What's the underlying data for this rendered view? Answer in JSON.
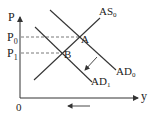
{
  "diagram": {
    "type": "AS-AD economics diagram",
    "axes": {
      "y_label": "P",
      "x_label": "y",
      "origin_label": "0"
    },
    "price_levels": [
      {
        "label": "P",
        "sub": "0",
        "y": 37
      },
      {
        "label": "P",
        "sub": "1",
        "y": 53
      }
    ],
    "curves": [
      {
        "name": "AS",
        "sub": "0",
        "x1": 34,
        "y1": 80,
        "x2": 100,
        "y2": 18
      },
      {
        "name": "AD",
        "sub": "0",
        "x1": 50,
        "y1": 10,
        "x2": 116,
        "y2": 70
      },
      {
        "name": "AD",
        "sub": "1",
        "x1": 35,
        "y1": 27,
        "x2": 92,
        "y2": 82
      }
    ],
    "points": [
      {
        "label": "A",
        "x": 79,
        "y": 37
      },
      {
        "label": "B",
        "x": 62,
        "y": 53
      }
    ],
    "shift_arrow": {
      "from": [
        97,
        57
      ],
      "to": [
        84,
        71
      ],
      "meaning": "AD shifts left from AD0 to AD1"
    },
    "output_arrow": {
      "from": [
        90,
        106
      ],
      "to": [
        67,
        106
      ],
      "meaning": "output decreases"
    },
    "colors": {
      "line": "#333333",
      "dash": "#555555",
      "background": "#ffffff"
    }
  }
}
